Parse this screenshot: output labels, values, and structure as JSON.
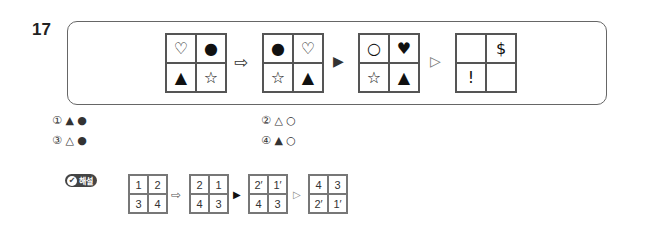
{
  "question": {
    "number": "17",
    "sequence": [
      {
        "type": "grid",
        "cells": [
          "♡",
          "●",
          "▲",
          "☆"
        ]
      },
      {
        "type": "op",
        "symbol": "⇨"
      },
      {
        "type": "grid",
        "cells": [
          "●",
          "♡",
          "☆",
          "▲"
        ]
      },
      {
        "type": "op",
        "symbol": "▶"
      },
      {
        "type": "grid",
        "cells": [
          "○",
          "♥",
          "☆",
          "▲"
        ]
      },
      {
        "type": "op",
        "symbol": "▷"
      },
      {
        "type": "grid",
        "cells": [
          "",
          "$",
          "!",
          ""
        ]
      }
    ]
  },
  "options": [
    {
      "num": "①",
      "text": "▲ ●"
    },
    {
      "num": "②",
      "text": "△ ○"
    },
    {
      "num": "③",
      "text": "△ ●"
    },
    {
      "num": "④",
      "text": "▲ ○"
    }
  ],
  "solution": {
    "badge_label": "해설",
    "badge_icon": "✔",
    "sequence": [
      {
        "type": "grid",
        "cells": [
          "1",
          "2",
          "3",
          "4"
        ]
      },
      {
        "type": "op",
        "symbol": "⇨"
      },
      {
        "type": "grid",
        "cells": [
          "2",
          "1",
          "4",
          "3"
        ]
      },
      {
        "type": "op",
        "symbol": "▶"
      },
      {
        "type": "grid",
        "cells": [
          "2′",
          "1′",
          "4",
          "3"
        ]
      },
      {
        "type": "op",
        "symbol": "▷"
      },
      {
        "type": "grid",
        "cells": [
          "4",
          "3",
          "2′",
          "1′"
        ]
      }
    ]
  }
}
